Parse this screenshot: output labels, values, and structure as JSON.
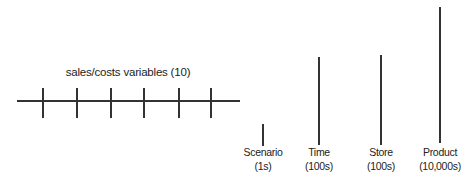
{
  "diagram": {
    "horizontal_group": {
      "title": "sales/costs variables (10)",
      "line": {
        "x1": 17,
        "x2": 240,
        "y": 100
      },
      "ticks": [
        42,
        76,
        110,
        143,
        178,
        210
      ],
      "tick_top": 88,
      "tick_bottom": 118
    },
    "dimensions": [
      {
        "name": "Scenario",
        "count": "(1s)",
        "x": 262,
        "top": 124,
        "bottom": 146
      },
      {
        "name": "Time",
        "count": "(100s)",
        "x": 318,
        "top": 57,
        "bottom": 145
      },
      {
        "name": "Store",
        "count": "(100s)",
        "x": 380,
        "top": 55,
        "bottom": 145
      },
      {
        "name": "Product",
        "count": "(10,000s)",
        "x": 439,
        "top": 7,
        "bottom": 143
      }
    ],
    "colors": {
      "line": "#333333",
      "text": "#222222"
    }
  }
}
